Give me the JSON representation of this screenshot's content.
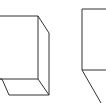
{
  "figure": {
    "stroke_color": "#333333",
    "background": "#ffffff",
    "shapes": [
      {
        "name": "box-left",
        "kind": "rectangular-prism"
      },
      {
        "name": "box-right",
        "kind": "rectangular-prism"
      }
    ]
  }
}
